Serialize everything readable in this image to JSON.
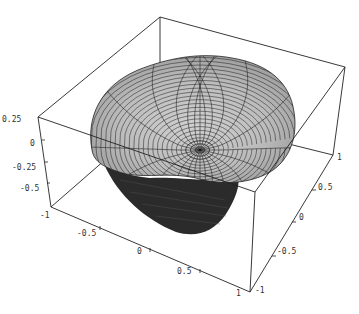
{
  "chart_data": {
    "type": "surface3d",
    "title": "",
    "axes": {
      "x": {
        "ticks": [
          "-1",
          "-0.5",
          "0",
          "0.5",
          "1"
        ],
        "range": [
          -1,
          1
        ]
      },
      "y": {
        "ticks": [
          "-1",
          "-0.5",
          "0",
          "0.5",
          "1"
        ],
        "range": [
          -1,
          1
        ]
      },
      "z": {
        "ticks": [
          "0.25",
          "0",
          "-0.25",
          "-0.5",
          "-1"
        ],
        "range": [
          -1,
          0.25
        ]
      }
    },
    "box": true,
    "colors": {
      "surface": "#bdbdbd",
      "underside": "#2b2b2b",
      "mesh": "#1a1a1a",
      "box": "#222222"
    }
  },
  "labels": {
    "z": [
      {
        "text": "0.25",
        "x": 2,
        "y": 122
      },
      {
        "text": "0",
        "x": 30,
        "y": 146
      },
      {
        "text": "-0.25",
        "x": 12,
        "y": 170
      },
      {
        "text": "-0.5",
        "x": 20,
        "y": 191
      },
      {
        "text": "-1",
        "x": 40,
        "y": 218
      }
    ],
    "x": [
      {
        "text": "-0.5",
        "x": 77,
        "y": 236
      },
      {
        "text": "0",
        "x": 137,
        "y": 254
      },
      {
        "text": "0.5",
        "x": 177,
        "y": 274
      },
      {
        "text": "1",
        "x": 236,
        "y": 296
      }
    ],
    "y": [
      {
        "text": "-1",
        "x": 255,
        "y": 293
      },
      {
        "text": "-0.5",
        "x": 277,
        "y": 254
      },
      {
        "text": "0",
        "x": 299,
        "y": 220
      },
      {
        "text": "0.5",
        "x": 318,
        "y": 190
      },
      {
        "text": "1",
        "x": 337,
        "y": 160
      }
    ]
  }
}
